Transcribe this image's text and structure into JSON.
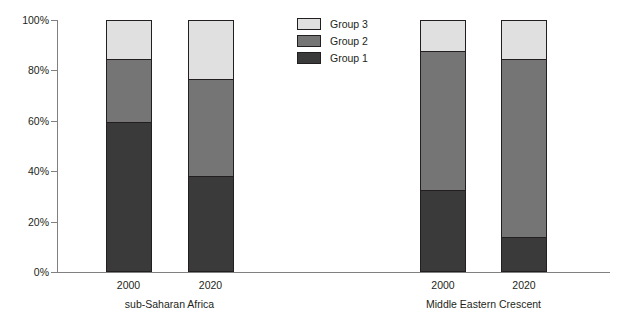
{
  "chart_data": {
    "type": "bar",
    "subtype": "stacked-100-percent",
    "title": "",
    "xlabel": "",
    "ylabel": "",
    "ylim": [
      0,
      100
    ],
    "ytick_labels": [
      "0%",
      "20%",
      "40%",
      "60%",
      "80%",
      "100%"
    ],
    "ytick_values": [
      0,
      20,
      40,
      60,
      80,
      100
    ],
    "grid": false,
    "legend_position": "top-center",
    "categories": [
      "2000",
      "2020",
      "2000",
      "2020"
    ],
    "groups": [
      {
        "name": "sub-Saharan Africa",
        "categories": [
          "2000",
          "2020"
        ]
      },
      {
        "name": "Middle Eastern Crescent",
        "categories": [
          "2000",
          "2020"
        ]
      }
    ],
    "series": [
      {
        "name": "Group 1",
        "color": "#3a3a3a",
        "values": [
          59.5,
          38.0,
          32.5,
          13.5
        ]
      },
      {
        "name": "Group 2",
        "color": "#757575",
        "values": [
          25.5,
          39.0,
          55.5,
          71.5
        ]
      },
      {
        "name": "Group 3",
        "color": "#e0e0e0",
        "values": [
          15.0,
          23.0,
          12.0,
          15.0
        ]
      }
    ],
    "bars": [
      {
        "group": "sub-Saharan Africa",
        "category": "2000",
        "segments": [
          {
            "name": "Group 1",
            "value": 59.5,
            "color": "#3a3a3a"
          },
          {
            "name": "Group 2",
            "value": 25.5,
            "color": "#757575"
          },
          {
            "name": "Group 3",
            "value": 15.0,
            "color": "#e0e0e0"
          }
        ]
      },
      {
        "group": "sub-Saharan Africa",
        "category": "2020",
        "segments": [
          {
            "name": "Group 1",
            "value": 38.0,
            "color": "#3a3a3a"
          },
          {
            "name": "Group 2",
            "value": 39.0,
            "color": "#757575"
          },
          {
            "name": "Group 3",
            "value": 23.0,
            "color": "#e0e0e0"
          }
        ]
      },
      {
        "group": "Middle Eastern Crescent",
        "category": "2000",
        "segments": [
          {
            "name": "Group 1",
            "value": 32.5,
            "color": "#3a3a3a"
          },
          {
            "name": "Group 2",
            "value": 55.5,
            "color": "#757575"
          },
          {
            "name": "Group 3",
            "value": 12.0,
            "color": "#e0e0e0"
          }
        ]
      },
      {
        "group": "Middle Eastern Crescent",
        "category": "2020",
        "segments": [
          {
            "name": "Group 1",
            "value": 13.5,
            "color": "#3a3a3a"
          },
          {
            "name": "Group 2",
            "value": 71.5,
            "color": "#757575"
          },
          {
            "name": "Group 3",
            "value": 15.0,
            "color": "#e0e0e0"
          }
        ]
      }
    ],
    "legend": [
      {
        "label": "Group 3",
        "color": "#e0e0e0"
      },
      {
        "label": "Group 2",
        "color": "#757575"
      },
      {
        "label": "Group 1",
        "color": "#3a3a3a"
      }
    ]
  },
  "colors": {
    "group1": "#3a3a3a",
    "group2": "#757575",
    "group3": "#e0e0e0",
    "axis": "#808080",
    "outline": "#231f20",
    "text": "#231f20",
    "background": "#ffffff"
  },
  "layout": {
    "bar_x_centers": [
      128.5,
      210.5,
      443.0,
      524.0
    ],
    "bar_width": 46,
    "group_label_centers": [
      169.5,
      483.5
    ],
    "plot_left": 57,
    "plot_top": 20,
    "plot_bottom": 272,
    "plot_right": 610
  }
}
